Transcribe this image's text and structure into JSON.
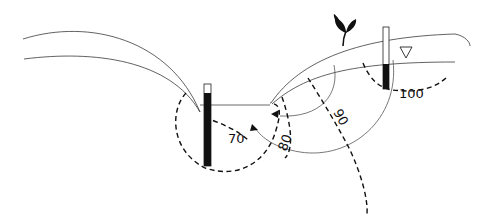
{
  "diagram": {
    "type": "groundwater flow net cross-section",
    "colors": {
      "background": "#ffffff",
      "lines": "#333333",
      "equipotential": "#111111",
      "piezometer_water": "#111111"
    },
    "equipotential_labels": [
      {
        "id": "eq-70",
        "text": "70"
      },
      {
        "id": "eq-80",
        "text": "80"
      },
      {
        "id": "eq-90",
        "text": "90"
      },
      {
        "id": "eq-100",
        "text": "100"
      }
    ],
    "symbols": {
      "water_table": "water-table-triangle",
      "plant": "plant-icon",
      "piezometers": [
        "left-piezometer",
        "right-piezometer"
      ]
    }
  }
}
